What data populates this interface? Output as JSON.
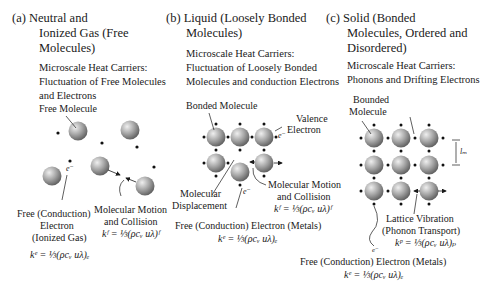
{
  "panels": [
    {
      "id": "a",
      "title_lines": [
        "(a) Neutral and",
        "Ionized Gas (Free",
        "Molecules)"
      ],
      "carriers_lines": [
        "Microscale Heat Carriers:",
        "Fluctuation of Free Molecules",
        "and Electrons"
      ],
      "labels": {
        "free_molecule": "Free Molecule",
        "electron_symbol": "e⁻",
        "free_electron_lines": [
          "Free  (Conduction)",
          "Electron",
          "(Ionized Gas)"
        ],
        "motion_lines": [
          "Molecular Motion",
          "and Collision"
        ],
        "eq_fluid": "kᶠ = ⅓(ρcᵥ uλ)ᶠ",
        "eq_electron": "kᵉ = ⅓(ρcᵥ uλ)ₑ"
      }
    },
    {
      "id": "b",
      "title_lines": [
        "(b) Liquid (Loosely Bonded",
        "Molecules)"
      ],
      "carriers_lines": [
        "Microscale Heat Carriers:",
        "Fluctuation of Loosely Bonded",
        "Molecules and conduction Electrons"
      ],
      "labels": {
        "bonded_molecule": "Bonded Molecule",
        "valence_lines": [
          "Valence",
          "Electron"
        ],
        "electron_symbol": "e⁻",
        "displacement_lines": [
          "Molecular",
          "Displacement"
        ],
        "motion_lines": [
          "Molecular Motion",
          "and Collision"
        ],
        "eq_fluid": "kᶠ = ⅓(ρcᵥ uλ)ᶠ",
        "free_electron": "Free (Conduction) Electron (Metals)",
        "eq_electron": "kᵉ = ⅓(ρcᵥ uλ)ₑ"
      }
    },
    {
      "id": "c",
      "title_lines": [
        "(c) Solid (Bonded",
        "Molecules, Ordered and",
        "Disordered)"
      ],
      "carriers_lines": [
        "Microscale Heat Carriers:",
        "Phonons and Drifting Electrons"
      ],
      "labels": {
        "bounded_molecule_lines": [
          "Bounded",
          "Molecule"
        ],
        "spacing": "lₘ",
        "lattice_lines": [
          "Lattice Vibration",
          "(Phonon Transport)"
        ],
        "eq_phonon": "kᵖ = ⅓(ρcᵥ uλ)ₚ",
        "electron_symbol": "e⁻",
        "free_electron": "Free (Conduction) Electron (Metals)",
        "eq_electron": "kᵉ = ⅓(ρcᵥ uλ)ₑ"
      }
    }
  ],
  "colors": {
    "sphere_light": "#e6e6e6",
    "sphere_dark": "#6e6e6e",
    "ink": "#1a1a1a"
  }
}
